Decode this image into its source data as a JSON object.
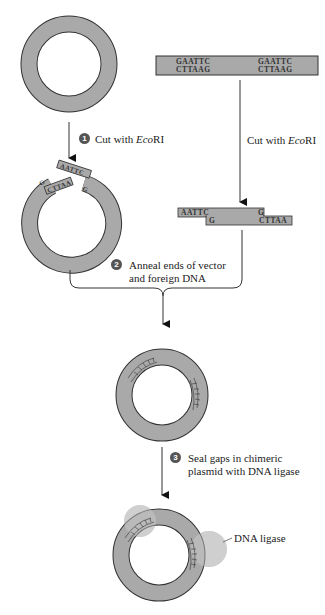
{
  "diagram": {
    "type": "process-flow",
    "topic": "Cloning foreign DNA into a plasmid vector using EcoRI and DNA ligase",
    "colors": {
      "dna": "#a9a9a9",
      "outline": "#333333",
      "ligase": "#cfcfcf",
      "step_badge": "#555555"
    },
    "foreign_dna": {
      "top_strand_left": "GAATTC",
      "bottom_strand_left": "CTTAAG",
      "top_strand_right": "GAATTC",
      "bottom_strand_right": "CTTAAG"
    },
    "foreign_cut_label_prefix": "Cut with ",
    "foreign_cut_label_enzyme": "Eco",
    "foreign_cut_label_suffix": "RI",
    "cut_fragment": {
      "top_left": "AATTC",
      "bottom_left": "G",
      "top_right": "G",
      "bottom_right": "CTTAA"
    },
    "vector_cut_ends": {
      "top": "AATTC",
      "top_right": "G",
      "bottom": "CTTAA",
      "bottom_left": "G"
    },
    "steps": [
      {
        "number": "1",
        "label_prefix": "Cut with ",
        "label_enzyme": "Eco",
        "label_suffix": "RI"
      },
      {
        "number": "2",
        "label_line1": "Anneal ends of vector",
        "label_line2": "and foreign DNA"
      },
      {
        "number": "3",
        "label_line1": "Seal gaps in chimeric",
        "label_line2": "plasmid with DNA ligase"
      }
    ],
    "ligase_label": "DNA ligase"
  }
}
